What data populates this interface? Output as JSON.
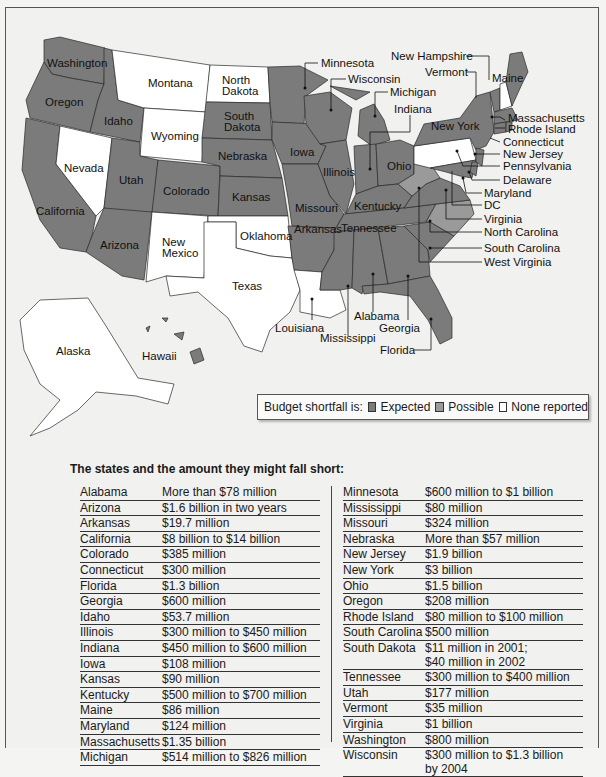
{
  "legend": {
    "prefix": "Budget shortfall is:",
    "items": [
      {
        "label": "Expected",
        "color": "#7b7b7b"
      },
      {
        "label": "Possible",
        "color": "#9a9a9a"
      },
      {
        "label": "None reported",
        "color": "#ffffff"
      }
    ]
  },
  "map_labels": {
    "washington": "Washington",
    "oregon": "Oregon",
    "california": "California",
    "idaho": "Idaho",
    "nevada": "Nevada",
    "montana": "Montana",
    "wyoming": "Wyoming",
    "utah": "Utah",
    "arizona": "Arizona",
    "colorado": "Colorado",
    "new_mexico_1": "New",
    "new_mexico_2": "Mexico",
    "north_dakota_1": "North",
    "north_dakota_2": "Dakota",
    "south_dakota_1": "South",
    "south_dakota_2": "Dakota",
    "nebraska": "Nebraska",
    "kansas": "Kansas",
    "oklahoma": "Oklahoma",
    "texas": "Texas",
    "iowa": "Iowa",
    "missouri": "Missouri",
    "arkansas": "Arkansas",
    "illinois": "Illinois",
    "ohio": "Ohio",
    "kentucky": "Kentucky",
    "tennessee": "Tennessee",
    "new_york": "New York",
    "maine": "Maine",
    "alaska": "Alaska",
    "hawaii": "Hawaii",
    "minnesota": "Minnesota",
    "wisconsin": "Wisconsin",
    "michigan": "Michigan",
    "indiana": "Indiana",
    "new_hampshire": "New Hampshire",
    "vermont": "Vermont",
    "massachusetts": "Massachusetts",
    "rhode_island": "Rhode Island",
    "connecticut": "Connecticut",
    "new_jersey": "New Jersey",
    "pennsylvania": "Pennsylvania",
    "delaware": "Delaware",
    "maryland": "Maryland",
    "dc": "DC",
    "virginia": "Virginia",
    "north_carolina": "North Carolina",
    "south_carolina": "South Carolina",
    "west_virginia": "West Virginia",
    "louisiana": "Louisiana",
    "mississippi": "Mississippi",
    "alabama": "Alabama",
    "georgia": "Georgia",
    "florida": "Florida"
  },
  "table": {
    "title": "The states and the amount they might fall short:",
    "left": [
      {
        "state": "Alabama",
        "amount": "More than $78 million"
      },
      {
        "state": "Arizona",
        "amount": "$1.6 billion in two years"
      },
      {
        "state": "Arkansas",
        "amount": "$19.7 million"
      },
      {
        "state": "California",
        "amount": "$8 billion to $14 billion"
      },
      {
        "state": "Colorado",
        "amount": "$385 million"
      },
      {
        "state": "Connecticut",
        "amount": "$300 million"
      },
      {
        "state": "Florida",
        "amount": "$1.3 billion"
      },
      {
        "state": "Georgia",
        "amount": "$600 million"
      },
      {
        "state": "Idaho",
        "amount": "$53.7 million"
      },
      {
        "state": "Illinois",
        "amount": "$300 million to $450 million"
      },
      {
        "state": "Indiana",
        "amount": "$450 million to $600 million"
      },
      {
        "state": "Iowa",
        "amount": "$108 million"
      },
      {
        "state": "Kansas",
        "amount": "$90 million"
      },
      {
        "state": "Kentucky",
        "amount": "$500 million to $700 million"
      },
      {
        "state": "Maine",
        "amount": "$86 million"
      },
      {
        "state": "Maryland",
        "amount": "$124 million"
      },
      {
        "state": "Massachusetts",
        "amount": "$1.35 billion"
      },
      {
        "state": "Michigan",
        "amount": "$514 million to $826 million"
      }
    ],
    "right": [
      {
        "state": "Minnesota",
        "amount": "$600 million to $1 billion"
      },
      {
        "state": "Mississippi",
        "amount": "$80 million"
      },
      {
        "state": "Missouri",
        "amount": "$324 million"
      },
      {
        "state": "Nebraska",
        "amount": "More than $57 million"
      },
      {
        "state": "New Jersey",
        "amount": "$1.9 billion"
      },
      {
        "state": "New York",
        "amount": "$3 billion"
      },
      {
        "state": "Ohio",
        "amount": "$1.5 billion"
      },
      {
        "state": "Oregon",
        "amount": "$208 million"
      },
      {
        "state": "Rhode Island",
        "amount": "$80 million to $100 million"
      },
      {
        "state": "South Carolina",
        "amount": "$500 million"
      },
      {
        "state": "South Dakota",
        "amount": "$11 million in 2001;",
        "amount2": "$40 million in 2002"
      },
      {
        "state": "Tennessee",
        "amount": "$300 million to $400 million"
      },
      {
        "state": "Utah",
        "amount": "$177 million"
      },
      {
        "state": "Vermont",
        "amount": "$35 million"
      },
      {
        "state": "Virginia",
        "amount": "$1 billion"
      },
      {
        "state": "Washington",
        "amount": "$800 million"
      },
      {
        "state": "Wisconsin",
        "amount": "$300 million to $1.3 billion",
        "amount2": "by 2004"
      }
    ]
  }
}
